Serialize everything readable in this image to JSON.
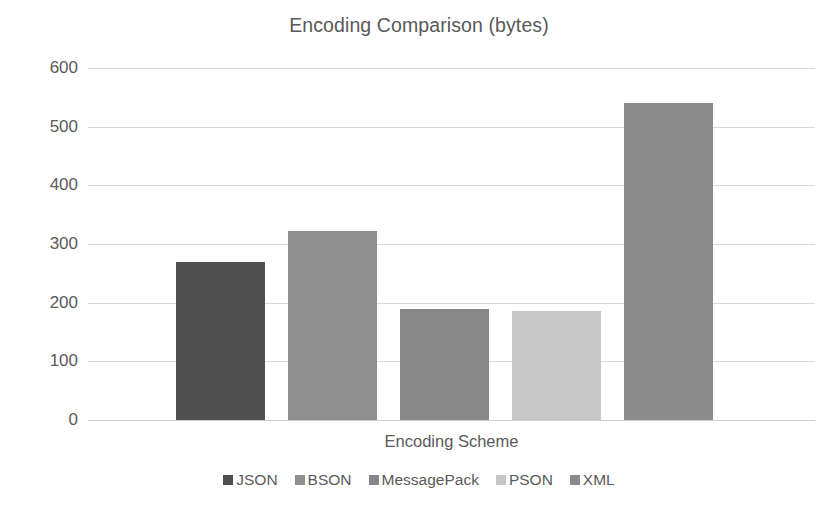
{
  "chart_data": {
    "type": "bar",
    "title": "Encoding Comparison (bytes)",
    "xlabel": "Encoding Scheme",
    "ylabel": "",
    "categories": [
      "JSON",
      "BSON",
      "MessagePack",
      "PSON",
      "XML"
    ],
    "values": [
      270,
      322,
      190,
      186,
      540
    ],
    "series": [
      {
        "name": "bytes",
        "values": [
          270,
          322,
          190,
          186,
          540
        ]
      }
    ],
    "colors": [
      "#4f4f4f",
      "#8f8f8f",
      "#878787",
      "#c6c6c6",
      "#8b8b8b"
    ],
    "ylim": [
      0,
      600
    ],
    "yticks": [
      "0",
      "100",
      "200",
      "300",
      "400",
      "500",
      "600"
    ],
    "ytick_values": [
      0,
      100,
      200,
      300,
      400,
      500,
      600
    ],
    "grid": true,
    "grid_axis": "y",
    "legend": [
      "JSON",
      "BSON",
      "MessagePack",
      "PSON",
      "XML"
    ],
    "legend_position": "bottom",
    "background": "#ffffff",
    "text_color": "#5a5a5a",
    "gridline_color": "#d9d9d9"
  }
}
